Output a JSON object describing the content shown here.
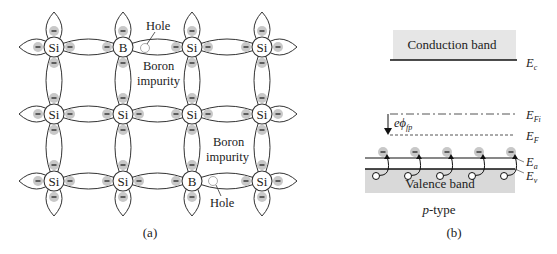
{
  "panel_a": {
    "caption": "(a)",
    "lattice": {
      "cols_x": [
        54,
        123,
        192,
        262
      ],
      "rows_y": [
        47,
        114,
        181
      ],
      "atoms": [
        [
          "Si",
          "B",
          "Si",
          "Si"
        ],
        [
          "Si",
          "Si",
          "Si",
          "Si"
        ],
        [
          "Si",
          "Si",
          "B",
          "Si"
        ]
      ]
    },
    "labels": {
      "hole_top": "Hole",
      "boron_top_line1": "Boron",
      "boron_top_line2": "impurity",
      "boron_bottom_line1": "Boron",
      "boron_bottom_line2": "impurity",
      "hole_bottom": "Hole"
    },
    "electron_symbol": "−"
  },
  "panel_b": {
    "caption": "(b)",
    "type_label_italic": "p",
    "type_label_rest": "-type",
    "conduction_band": "Conduction band",
    "valence_band": "Valence band",
    "levels": {
      "Ec": {
        "main": "E",
        "sub": "c"
      },
      "EFi": {
        "main": "E",
        "sub": "Fi"
      },
      "EF": {
        "main": "E",
        "sub": "F"
      },
      "Ea": {
        "main": "E",
        "sub": "a"
      },
      "Ev": {
        "main": "E",
        "sub": "v"
      }
    },
    "potential_label": {
      "prefix": "eϕ",
      "sub": "fp"
    },
    "acceptor_count": 5,
    "colors": {
      "band_fill": "#e6e6e6",
      "electron_fill": "#c8c8c8"
    }
  }
}
